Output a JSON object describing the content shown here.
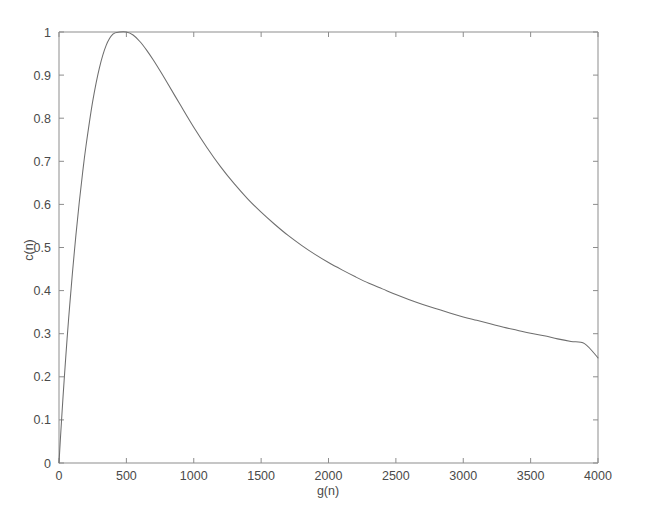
{
  "chart_data": {
    "type": "line",
    "title": "",
    "xlabel": "g(n)",
    "ylabel": "c(n)",
    "xlim": [
      0,
      4000
    ],
    "ylim": [
      0,
      1
    ],
    "grid": false,
    "legend": "none",
    "xticks": [
      0,
      500,
      1000,
      1500,
      2000,
      2500,
      3000,
      3500,
      4000
    ],
    "xticklabels": [
      "0",
      "500",
      "1000",
      "1500",
      "2000",
      "2500",
      "3000",
      "3500",
      "4000"
    ],
    "yticks": [
      0,
      0.1,
      0.2,
      0.3,
      0.4,
      0.5,
      0.6,
      0.7,
      0.8,
      0.9,
      1
    ],
    "yticklabels": [
      "0",
      "0.1",
      "0.2",
      "0.3",
      "0.4",
      "0.5",
      "0.6",
      "0.7",
      "0.8",
      "0.9",
      "1"
    ],
    "series": [
      {
        "name": "c(n)",
        "color": "#6e6e6e",
        "x": [
          0,
          10,
          20,
          30,
          40,
          50,
          60,
          70,
          80,
          90,
          100,
          125,
          150,
          175,
          200,
          250,
          300,
          350,
          400,
          450,
          500,
          550,
          600,
          650,
          700,
          750,
          800,
          900,
          1000,
          1100,
          1200,
          1300,
          1400,
          1500,
          1600,
          1700,
          1800,
          1900,
          2000,
          2100,
          2200,
          2300,
          2400,
          2500,
          2600,
          2700,
          2800,
          2900,
          3000,
          3100,
          3200,
          3300,
          3400,
          3500,
          3600,
          3700,
          3800,
          3900,
          4000
        ],
        "y": [
          0.0,
          0.054,
          0.105,
          0.154,
          0.2,
          0.245,
          0.288,
          0.329,
          0.368,
          0.405,
          0.442,
          0.527,
          0.604,
          0.673,
          0.735,
          0.839,
          0.917,
          0.969,
          0.995,
          1.0,
          1.0,
          0.993,
          0.978,
          0.958,
          0.935,
          0.91,
          0.884,
          0.831,
          0.779,
          0.731,
          0.687,
          0.648,
          0.613,
          0.582,
          0.554,
          0.528,
          0.505,
          0.484,
          0.465,
          0.448,
          0.432,
          0.417,
          0.404,
          0.391,
          0.379,
          0.368,
          0.358,
          0.348,
          0.339,
          0.331,
          0.323,
          0.315,
          0.308,
          0.301,
          0.295,
          0.288,
          0.282,
          0.277,
          0.244
        ]
      }
    ]
  },
  "axes": {
    "xlabel": "g(n)",
    "ylabel": "c(n)"
  }
}
